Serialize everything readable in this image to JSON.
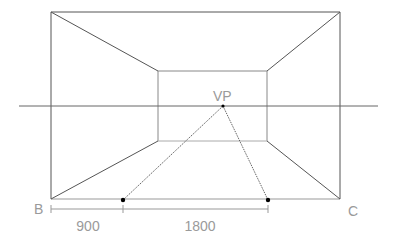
{
  "diagram": {
    "labels": {
      "vp": "VP",
      "b": "B",
      "c": "C"
    },
    "dimensions": [
      {
        "label": "900"
      },
      {
        "label": "1800"
      }
    ],
    "colors": {
      "outer_lines": "#555555",
      "inner_lines": "#8a8a8a",
      "horizon": "#666666",
      "label": "#9a9a9a",
      "point": "#000000"
    }
  }
}
